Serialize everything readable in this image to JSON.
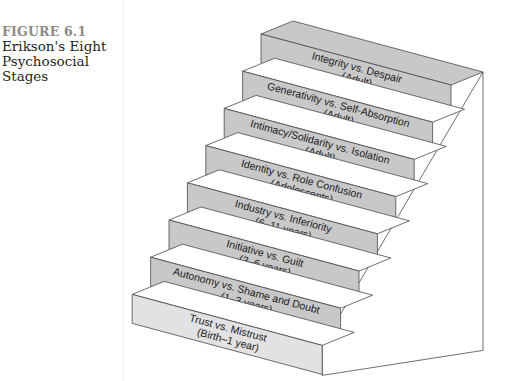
{
  "figure": {
    "label": "FIGURE 6.1",
    "title_lines": [
      "Erikson's Eight",
      "Psychosocial",
      "Stages"
    ]
  },
  "colors": {
    "riser": "#c8c8c8",
    "riser_bottom": "#e2e2e2",
    "tread": "#ffffff",
    "edge": "#4a4a4a",
    "label_color": "#8a8a8a"
  },
  "stages": [
    {
      "name": "Integrity vs. Despair",
      "age": "(Adult)"
    },
    {
      "name": "Generativity vs. Self-Absorption",
      "age": "(Adult)"
    },
    {
      "name": "Intimacy/Solidarity vs. Isolation",
      "age": "(Adult)"
    },
    {
      "name": "Identity vs. Role Confusion",
      "age": "(Adolescents)"
    },
    {
      "name": "Industry vs. Inferiority",
      "age": "(6–11 years)"
    },
    {
      "name": "Initiative vs. Guilt",
      "age": "(3–6 years)"
    },
    {
      "name": "Autonomy vs. Shame and Doubt",
      "age": "(1–3 years)"
    },
    {
      "name": "Trust vs. Mistrust",
      "age": "(Birth–1 year)"
    }
  ]
}
